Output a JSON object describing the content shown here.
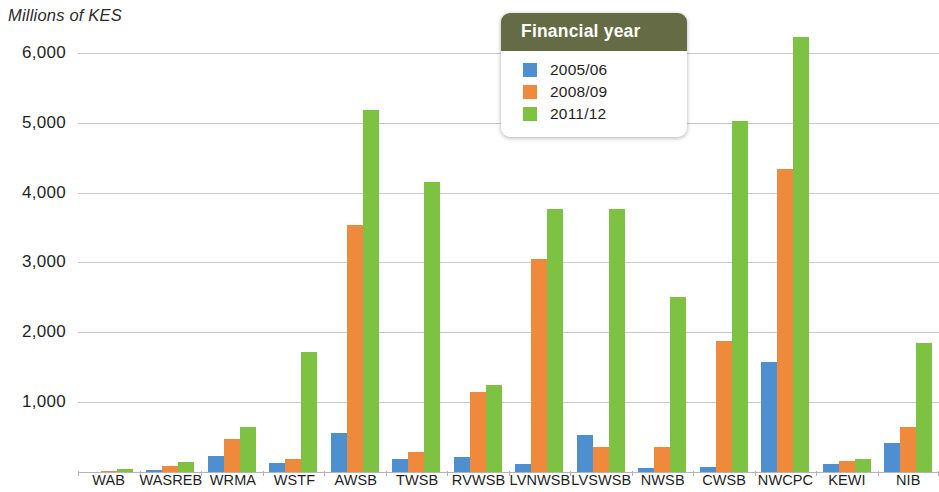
{
  "chart_data": {
    "type": "bar",
    "title": "",
    "subtitle": "",
    "ylabel": "Millions of KES",
    "xlabel": "",
    "ylim": [
      0,
      6500
    ],
    "yticks": [
      6000,
      5000,
      4000,
      3000,
      2000,
      1000
    ],
    "ytick_labels": [
      "6,000",
      "5,000",
      "4,000",
      "3,000",
      "2,000",
      "1,000"
    ],
    "grid": true,
    "legend_position": "top-center",
    "legend_title": "Financial year",
    "categories": [
      "WAB",
      "WASREB",
      "WRMA",
      "WSTF",
      "AWSB",
      "TWSB",
      "RVWSB",
      "LVNWSB",
      "LVSWSB",
      "NWSB",
      "CWSB",
      "NWCPC",
      "KEWI",
      "NIB"
    ],
    "series": [
      {
        "name": "2005/06",
        "color": "#4e8fcf",
        "values": [
          0,
          30,
          230,
          130,
          560,
          180,
          220,
          110,
          530,
          60,
          70,
          1580,
          110,
          410
        ]
      },
      {
        "name": "2008/09",
        "color": "#ef8a3c",
        "values": [
          20,
          80,
          470,
          180,
          3530,
          290,
          1150,
          3050,
          360,
          360,
          1870,
          4340,
          160,
          650
        ]
      },
      {
        "name": "2011/12",
        "color": "#7dc242",
        "values": [
          50,
          140,
          650,
          1720,
          5180,
          4150,
          1240,
          3770,
          3770,
          2500,
          5020,
          6230,
          180,
          1850
        ]
      }
    ]
  },
  "legend": {
    "title": "Financial year",
    "items": [
      {
        "label": "2005/06",
        "color": "#4e8fcf"
      },
      {
        "label": "2008/09",
        "color": "#ef8a3c"
      },
      {
        "label": "2011/12",
        "color": "#7dc242"
      }
    ]
  },
  "colors": {
    "series_2005_06": "#4e8fcf",
    "series_2008_09": "#ef8a3c",
    "series_2011_12": "#7dc242",
    "legend_header": "#656b44",
    "gridline": "#c9c9c9",
    "text": "#1f1f1f"
  }
}
